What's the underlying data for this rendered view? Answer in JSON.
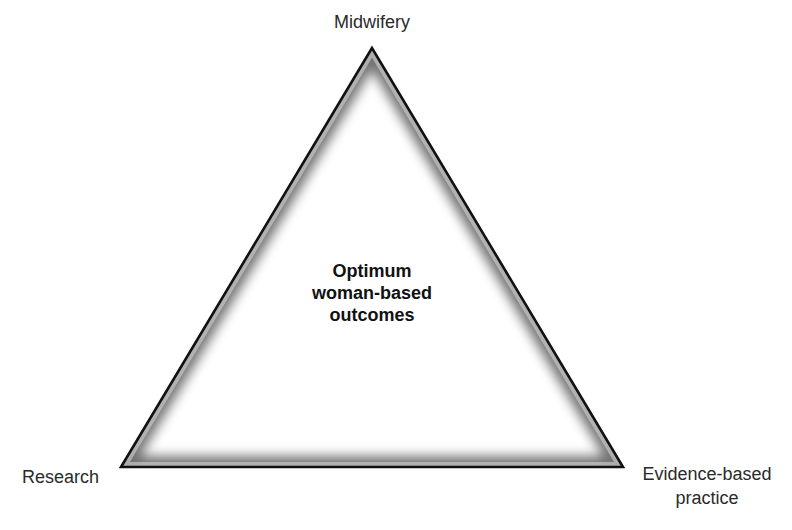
{
  "diagram": {
    "type": "triangle",
    "colors": {
      "outline": "#111111",
      "inner_shade": "#c8c8c8",
      "fill": "#ffffff",
      "text": "#2a2a2a"
    },
    "center": {
      "lines": [
        "Optimum",
        "woman-based",
        "outcomes"
      ]
    },
    "vertices": {
      "top": {
        "label": "Midwifery"
      },
      "bottom_left": {
        "label": "Research"
      },
      "bottom_right": {
        "lines": [
          "Evidence-based",
          "practice"
        ]
      }
    }
  }
}
